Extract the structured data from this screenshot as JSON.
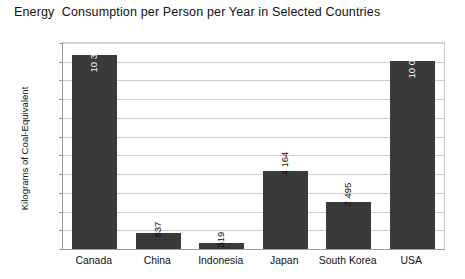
{
  "chart_data": {
    "type": "bar",
    "title": "Energy  Consumption per Person per Year in Selected Countries",
    "xlabel": "",
    "ylabel": "Kilograms of Coal-Equivalent",
    "categories": [
      "Canada",
      "China",
      "Indonesia",
      "Japan",
      "South Korea",
      "USA"
    ],
    "values": [
      10337,
      837,
      319,
      4164,
      2495,
      10034
    ],
    "value_labels": [
      "10 337",
      "837",
      "319",
      "4 164",
      "2 495",
      "10 034"
    ],
    "ylim": [
      0,
      11000
    ],
    "ytick_step": 1000,
    "ytick_labels": [
      "11 000",
      "10 000",
      "9 000",
      "8 000",
      "7 000",
      "6 000",
      "5 000",
      "4 000",
      "3 000",
      "2 000",
      "1 000",
      "0"
    ],
    "ytick_values": [
      11000,
      10000,
      9000,
      8000,
      7000,
      6000,
      5000,
      4000,
      3000,
      2000,
      1000,
      0
    ],
    "grid": true,
    "legend": false,
    "legend_position": "none",
    "bar_color": "#3a3a3a",
    "grid_color": "#cfcfcf",
    "axis_color": "#9a9a9a",
    "background_color": "#ffffff",
    "text_color": "#111111",
    "value_label_orientation": "vertical",
    "value_label_inside_threshold": 9000
  }
}
